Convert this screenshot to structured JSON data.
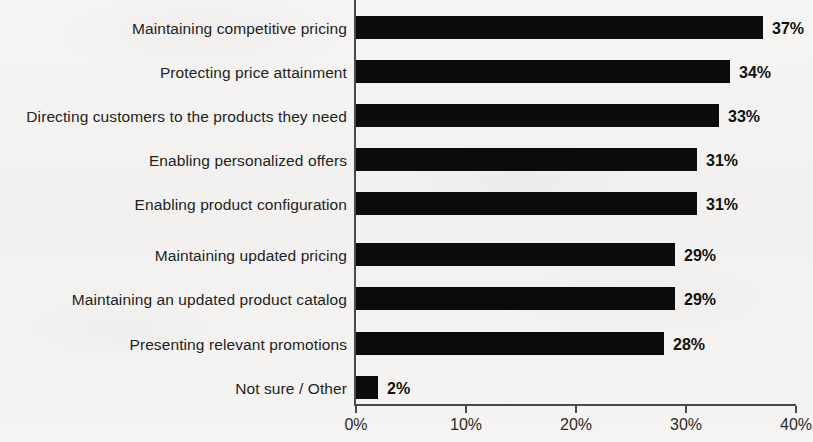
{
  "chart_data": {
    "type": "bar",
    "orientation": "horizontal",
    "title": "",
    "subtitle": "",
    "xlabel": "",
    "ylabel": "",
    "xlim": [
      0,
      40
    ],
    "xticks": [
      0,
      10,
      20,
      30,
      40
    ],
    "xtick_labels": [
      "0%",
      "10%",
      "20%",
      "30%",
      "40%"
    ],
    "grid": false,
    "legend": null,
    "value_suffix": "%",
    "bar_color": "#0b0b0b",
    "background_color": "#f4f3f1",
    "categories": [
      "Maintaining competitive pricing",
      "Protecting price attainment",
      "Directing customers to the products they need",
      "Enabling personalized offers",
      "Enabling product configuration",
      "Maintaining updated pricing",
      "Maintaining an updated product catalog",
      "Presenting relevant promotions",
      "Not sure / Other"
    ],
    "values": [
      37,
      34,
      33,
      31,
      31,
      29,
      29,
      28,
      2
    ],
    "value_labels": [
      "37%",
      "34%",
      "33%",
      "31%",
      "31%",
      "29%",
      "29%",
      "28%",
      "2%"
    ]
  }
}
